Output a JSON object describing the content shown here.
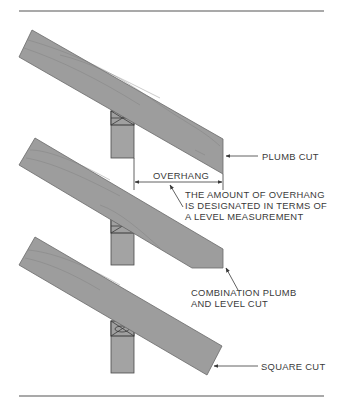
{
  "figure": {
    "colors": {
      "wood": "#9d9d9d",
      "outline": "#4a4a4a",
      "text": "#3a3a3a",
      "rule": "#555555"
    },
    "panels": [
      {
        "name": "plumb-cut-rafter",
        "label": "PLUMB CUT"
      },
      {
        "name": "combination-cut-rafter",
        "overhang_label": "OVERHANG",
        "overhang_note": [
          "THE AMOUNT OF OVERHANG",
          "IS DESIGNATED IN TERMS OF",
          "A LEVEL MEASUREMENT"
        ],
        "label": [
          "COMBINATION PLUMB",
          "AND LEVEL CUT"
        ]
      },
      {
        "name": "square-cut-rafter",
        "label": "SQUARE CUT"
      }
    ]
  }
}
